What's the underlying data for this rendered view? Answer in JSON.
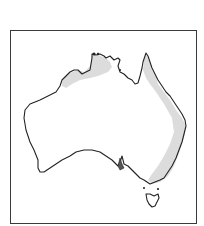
{
  "map": {
    "region": "Australia",
    "feature": "shaded distribution range",
    "shaded_areas": [
      "Northern coast (Kimberley to Arnhem Land)",
      "East coast (Cape York to Victoria)"
    ],
    "colors": {
      "background": "#ffffff",
      "frame": "#3a3a3a",
      "coastline": "#222222",
      "range_fill": "#dcdcdc"
    }
  }
}
